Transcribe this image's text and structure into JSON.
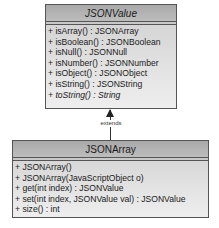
{
  "classes": {
    "parent": {
      "name": "JSONValue",
      "abstract": true,
      "members": [
        {
          "text": "+ isArray() : JSONArray",
          "italic": false
        },
        {
          "text": "+ isBoolean() : JSONBoolean",
          "italic": false
        },
        {
          "text": "+ isNull() : JSONNull",
          "italic": false
        },
        {
          "text": "+ isNumber() : JSONNumber",
          "italic": false
        },
        {
          "text": "+ isObject() : JSONObject",
          "italic": false
        },
        {
          "text": "+ isString() : JSONString",
          "italic": false
        },
        {
          "text": "+ toString() : String",
          "italic": true
        }
      ]
    },
    "child": {
      "name": "JSONArray",
      "abstract": false,
      "members": [
        {
          "text": "+ JSONArray()",
          "italic": false
        },
        {
          "text": "+ JSONArray(JavaScriptObject o)",
          "italic": false
        },
        {
          "text": "+ get(int index) : JSONValue",
          "italic": false
        },
        {
          "text": "+ set(int index, JSONValue val) : JSONValue",
          "italic": false
        },
        {
          "text": "+ size() : int",
          "italic": false
        }
      ]
    }
  },
  "relationship": {
    "label": "extends",
    "from": "JSONArray",
    "to": "JSONValue"
  },
  "colors": {
    "header": "#b5b5b5",
    "body": "#dcdcdc",
    "border": "#555555"
  }
}
